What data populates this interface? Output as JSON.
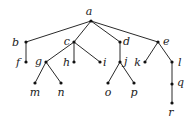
{
  "diagram": {
    "type": "rooted-tree",
    "colors": {
      "edge": "#2a2a2a",
      "node": "#111111",
      "label": "#222222",
      "background": "#ffffff"
    },
    "nodes": [
      {
        "id": "a",
        "label": "a",
        "x": 91,
        "y": 21,
        "lx": 89,
        "ly": 15,
        "anchor": "middle"
      },
      {
        "id": "b",
        "label": "b",
        "x": 26,
        "y": 42,
        "lx": 19,
        "ly": 46,
        "anchor": "end"
      },
      {
        "id": "c",
        "label": "c",
        "x": 74,
        "y": 42,
        "lx": 70,
        "ly": 45,
        "anchor": "end"
      },
      {
        "id": "d",
        "label": "d",
        "x": 120,
        "y": 42,
        "lx": 123,
        "ly": 45,
        "anchor": "start"
      },
      {
        "id": "e",
        "label": "e",
        "x": 158,
        "y": 42,
        "lx": 163,
        "ly": 45,
        "anchor": "start"
      },
      {
        "id": "f",
        "label": "f",
        "x": 26,
        "y": 62,
        "lx": 20,
        "ly": 66,
        "anchor": "end"
      },
      {
        "id": "g",
        "label": "g",
        "x": 46,
        "y": 62,
        "lx": 42,
        "ly": 65,
        "anchor": "end"
      },
      {
        "id": "h",
        "label": "h",
        "x": 74,
        "y": 62,
        "lx": 70,
        "ly": 66,
        "anchor": "end"
      },
      {
        "id": "i",
        "label": "i",
        "x": 100,
        "y": 62,
        "lx": 103,
        "ly": 66,
        "anchor": "start"
      },
      {
        "id": "j",
        "label": "j",
        "x": 120,
        "y": 62,
        "lx": 124,
        "ly": 65,
        "anchor": "start"
      },
      {
        "id": "k",
        "label": "k",
        "x": 145,
        "y": 62,
        "lx": 141,
        "ly": 66,
        "anchor": "end"
      },
      {
        "id": "l",
        "label": "l",
        "x": 172,
        "y": 62,
        "lx": 178,
        "ly": 66,
        "anchor": "start"
      },
      {
        "id": "m",
        "label": "m",
        "x": 35,
        "y": 83,
        "lx": 35,
        "ly": 96,
        "anchor": "middle"
      },
      {
        "id": "n",
        "label": "n",
        "x": 61,
        "y": 83,
        "lx": 61,
        "ly": 96,
        "anchor": "middle"
      },
      {
        "id": "o",
        "label": "o",
        "x": 108,
        "y": 83,
        "lx": 108,
        "ly": 96,
        "anchor": "middle"
      },
      {
        "id": "p",
        "label": "p",
        "x": 134,
        "y": 83,
        "lx": 134,
        "ly": 96,
        "anchor": "middle"
      },
      {
        "id": "q",
        "label": "q",
        "x": 172,
        "y": 84,
        "lx": 177,
        "ly": 86,
        "anchor": "start"
      },
      {
        "id": "r",
        "label": "r",
        "x": 172,
        "y": 103,
        "lx": 171,
        "ly": 116,
        "anchor": "middle"
      }
    ],
    "edges": [
      [
        "a",
        "b"
      ],
      [
        "a",
        "c"
      ],
      [
        "a",
        "d"
      ],
      [
        "a",
        "e"
      ],
      [
        "b",
        "f"
      ],
      [
        "c",
        "g"
      ],
      [
        "c",
        "h"
      ],
      [
        "c",
        "i"
      ],
      [
        "d",
        "j"
      ],
      [
        "e",
        "k"
      ],
      [
        "e",
        "l"
      ],
      [
        "g",
        "m"
      ],
      [
        "g",
        "n"
      ],
      [
        "j",
        "o"
      ],
      [
        "j",
        "p"
      ],
      [
        "l",
        "q"
      ],
      [
        "q",
        "r"
      ]
    ]
  }
}
